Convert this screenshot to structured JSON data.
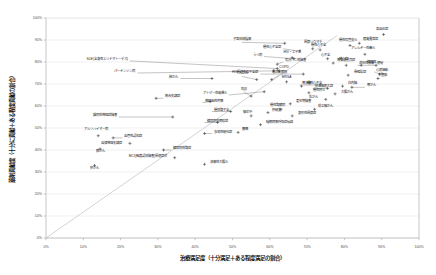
{
  "chart_data": {
    "type": "scatter",
    "title": "",
    "xlabel": "治療満足度（十分満足＋ある程度満足の割合）",
    "ylabel": "薬剤貢献度（十分に貢献＋ある程度貢献の割合）",
    "xlim": [
      0,
      100
    ],
    "ylim": [
      0,
      100
    ],
    "xticks": [
      "0%",
      "10%",
      "20%",
      "30%",
      "40%",
      "50%",
      "60%",
      "70%",
      "80%",
      "90%",
      "100%"
    ],
    "yticks": [
      "0%",
      "10%",
      "20%",
      "30%",
      "40%",
      "50%",
      "60%",
      "70%",
      "80%",
      "90%",
      "100%"
    ],
    "grid": true,
    "legend": "none",
    "reference_line": {
      "from": [
        0,
        0
      ],
      "to": [
        78,
        92
      ],
      "style": "diagonal"
    },
    "marker_style": "cross",
    "points": [
      {
        "label": "SLE(全身性エリテマトーデス)",
        "x": 62.0,
        "y": 77.0,
        "lx": 22.5,
        "ly": 80.5,
        "anchor": "end"
      },
      {
        "label": "パーキンソン病",
        "x": 62.5,
        "y": 76.0,
        "lx": 24.5,
        "ly": 75.0,
        "anchor": "end"
      },
      {
        "label": "肺がん",
        "x": 44.5,
        "y": 72.5,
        "lx": 36.0,
        "ly": 72.5,
        "anchor": "end"
      },
      {
        "label": "統合失調症",
        "x": 29.5,
        "y": 63.5,
        "lx": 31.5,
        "ly": 63.5,
        "anchor": "start"
      },
      {
        "label": "神経因性疼痛",
        "x": 44.0,
        "y": 62.0,
        "lx": 42.0,
        "ly": 61.5,
        "anchor": "start"
      },
      {
        "label": "躁病性神経症障害",
        "x": 34.0,
        "y": 55.0,
        "lx": 19.5,
        "ly": 55.0,
        "anchor": "end"
      },
      {
        "label": "アルツハイマー病",
        "x": 14.0,
        "y": 46.5,
        "lx": 13.5,
        "ly": 48.5,
        "anchor": "middle"
      },
      {
        "label": "血管性認知症",
        "x": 18.0,
        "y": 45.5,
        "lx": 20.5,
        "ly": 45.5,
        "anchor": "start"
      },
      {
        "label": "膵がん",
        "x": 14.5,
        "y": 40.5,
        "lx": 14.5,
        "ly": 38.5,
        "anchor": "middle"
      },
      {
        "label": "糖尿病性腎症",
        "x": 31.5,
        "y": 40.0,
        "lx": 33.5,
        "ly": 40.0,
        "anchor": "start"
      },
      {
        "label": "多発性硬化症",
        "x": 42.5,
        "y": 47.5,
        "lx": 44.5,
        "ly": 47.5,
        "anchor": "start"
      },
      {
        "label": "うつ病",
        "x": 66.5,
        "y": 81.5,
        "lx": 58.5,
        "ly": 82.5,
        "anchor": "end"
      },
      {
        "label": "子宮体部腫瘍",
        "x": 64.0,
        "y": 88.5,
        "lx": 52.5,
        "ly": 89.5,
        "anchor": "middle"
      },
      {
        "label": "てんかん",
        "x": 56.5,
        "y": 72.0,
        "lx": 52.5,
        "ly": 74.0,
        "anchor": "middle"
      },
      {
        "label": "過活動膀胱",
        "x": 60.5,
        "y": 72.0,
        "lx": 62.5,
        "ly": 74.5,
        "anchor": "middle"
      },
      {
        "label": "気分バニ性障害",
        "x": 62.0,
        "y": 79.0,
        "lx": 63.5,
        "ly": 80.0,
        "anchor": "start"
      },
      {
        "label": "COPD",
        "x": 61.0,
        "y": 76.0,
        "lx": 62.0,
        "ly": 77.0,
        "anchor": "start"
      },
      {
        "label": "HIV関連免疫不全症",
        "x": 69.0,
        "y": 74.5,
        "lx": 57.5,
        "ly": 74.5,
        "anchor": "end"
      },
      {
        "label": "MRSA",
        "x": 64.5,
        "y": 71.0,
        "lx": 64.5,
        "ly": 72.5,
        "anchor": "middle"
      },
      {
        "label": "HIV・エイズ",
        "x": 66.0,
        "y": 82.0,
        "lx": 66.0,
        "ly": 83.5,
        "anchor": "middle"
      },
      {
        "label": "関節リウマチ",
        "x": 71.5,
        "y": 86.0,
        "lx": 71.5,
        "ly": 88.0,
        "anchor": "middle"
      },
      {
        "label": "アトピー性皮膚炎",
        "x": 58.5,
        "y": 66.5,
        "lx": 49.0,
        "ly": 65.0,
        "anchor": "end"
      },
      {
        "label": "喘息",
        "x": 55.0,
        "y": 64.5,
        "lx": 53.0,
        "ly": 67.0,
        "anchor": "middle"
      },
      {
        "label": "慢性心不全",
        "x": 68.5,
        "y": 69.0,
        "lx": 69.5,
        "ly": 69.5,
        "anchor": "start"
      },
      {
        "label": "慢性肝炎",
        "x": 70.5,
        "y": 66.0,
        "lx": 71.0,
        "ly": 66.5,
        "anchor": "start"
      },
      {
        "label": "胃潰瘍",
        "x": 73.5,
        "y": 69.5,
        "lx": 68.0,
        "ly": 69.5,
        "anchor": "start"
      },
      {
        "label": "前立腺肥大症",
        "x": 75.5,
        "y": 68.0,
        "lx": 71.5,
        "ly": 68.0,
        "anchor": "start"
      },
      {
        "label": "慢性心不全",
        "x": 73.5,
        "y": 85.5,
        "lx": 73.0,
        "ly": 87.0,
        "anchor": "middle"
      },
      {
        "label": "慢性心不全症",
        "x": 68.0,
        "y": 85.0,
        "lx": 63.5,
        "ly": 86.0,
        "anchor": "end"
      },
      {
        "label": "心不全",
        "x": 75.5,
        "y": 81.5,
        "lx": 75.0,
        "ly": 82.5,
        "anchor": "middle"
      },
      {
        "label": "狭心症",
        "x": 77.0,
        "y": 79.5,
        "lx": 78.0,
        "ly": 80.5,
        "anchor": "start"
      },
      {
        "label": "胃食道逆流症",
        "x": 80.5,
        "y": 78.5,
        "lx": 80.5,
        "ly": 80.0,
        "anchor": "middle"
      },
      {
        "label": "慢性気管支炎",
        "x": 81.5,
        "y": 87.5,
        "lx": 81.0,
        "ly": 89.0,
        "anchor": "middle"
      },
      {
        "label": "脂質異常症",
        "x": 84.0,
        "y": 88.5,
        "lx": 84.5,
        "ly": 89.5,
        "anchor": "start"
      },
      {
        "label": "高血圧症",
        "x": 90.5,
        "y": 92.5,
        "lx": 90.0,
        "ly": 94.0,
        "anchor": "middle"
      },
      {
        "label": "アレルギー性鼻炎",
        "x": 85.5,
        "y": 83.5,
        "lx": 85.0,
        "ly": 85.5,
        "anchor": "middle"
      },
      {
        "label": "糖尿病",
        "x": 84.5,
        "y": 78.5,
        "lx": 85.5,
        "ly": 79.0,
        "anchor": "start"
      },
      {
        "label": "消化性潰瘍・便秘",
        "x": 88.5,
        "y": 78.5,
        "lx": 83.5,
        "ly": 78.5,
        "anchor": "start"
      },
      {
        "label": "心房細動",
        "x": 89.5,
        "y": 74.5,
        "lx": 88.0,
        "ly": 75.5,
        "anchor": "start"
      },
      {
        "label": "不整脈",
        "x": 89.0,
        "y": 72.5,
        "lx": 88.5,
        "ly": 73.0,
        "anchor": "start"
      },
      {
        "label": "骨粗鬆症",
        "x": 81.0,
        "y": 74.0,
        "lx": 82.0,
        "ly": 74.5,
        "anchor": "start"
      },
      {
        "label": "白内障",
        "x": 79.5,
        "y": 69.0,
        "lx": 80.5,
        "ly": 69.5,
        "anchor": "start"
      },
      {
        "label": "胃がん",
        "x": 82.0,
        "y": 68.5,
        "lx": 85.5,
        "ly": 68.5,
        "anchor": "start"
      },
      {
        "label": "大腸がん",
        "x": 77.5,
        "y": 65.5,
        "lx": 78.5,
        "ly": 65.5,
        "anchor": "start"
      },
      {
        "label": "乳がん",
        "x": 75.0,
        "y": 63.0,
        "lx": 73.5,
        "ly": 63.0,
        "anchor": "end"
      },
      {
        "label": "更年期障害",
        "x": 65.5,
        "y": 61.0,
        "lx": 66.5,
        "ly": 61.5,
        "anchor": "start"
      },
      {
        "label": "慢性腎臓病",
        "x": 63.0,
        "y": 58.5,
        "lx": 62.0,
        "ly": 59.5,
        "anchor": "middle"
      },
      {
        "label": "前立腺がん",
        "x": 72.0,
        "y": 58.5,
        "lx": 72.5,
        "ly": 59.0,
        "anchor": "start"
      },
      {
        "label": "肝硬変",
        "x": 59.5,
        "y": 57.0,
        "lx": 60.0,
        "ly": 57.5,
        "anchor": "start"
      },
      {
        "label": "脳卒中",
        "x": 55.0,
        "y": 55.5,
        "lx": 54.0,
        "ly": 56.5,
        "anchor": "middle"
      },
      {
        "label": "変形性関節症",
        "x": 66.0,
        "y": 55.5,
        "lx": 67.0,
        "ly": 56.0,
        "anchor": "start"
      },
      {
        "label": "慢性腎不全",
        "x": 49.5,
        "y": 57.5,
        "lx": 44.5,
        "ly": 57.5,
        "anchor": "start"
      },
      {
        "label": "糖尿病性網膜症",
        "x": 46.0,
        "y": 52.5,
        "lx": 42.5,
        "ly": 52.5,
        "anchor": "start"
      },
      {
        "label": "睡眠時無呼吸症候群",
        "x": 57.5,
        "y": 51.5,
        "lx": 58.5,
        "ly": 52.0,
        "anchor": "start"
      },
      {
        "label": "腰痛",
        "x": 51.5,
        "y": 48.0,
        "lx": 52.0,
        "ly": 48.5,
        "anchor": "start"
      },
      {
        "label": "肝がん",
        "x": 13.0,
        "y": 33.0,
        "lx": 13.0,
        "ly": 31.0,
        "anchor": "middle"
      },
      {
        "label": "潰瘍性大腸炎",
        "x": 42.5,
        "y": 33.5,
        "lx": 43.5,
        "ly": 33.5,
        "anchor": "start"
      },
      {
        "label": "MCI(軽度認知障害)関連症状",
        "x": 34.5,
        "y": 36.5,
        "lx": 33.0,
        "ly": 36.5,
        "anchor": "end"
      },
      {
        "label": "自律神経失調症",
        "x": 22.5,
        "y": 43.0,
        "lx": 21.0,
        "ly": 42.5,
        "anchor": "end"
      }
    ]
  }
}
